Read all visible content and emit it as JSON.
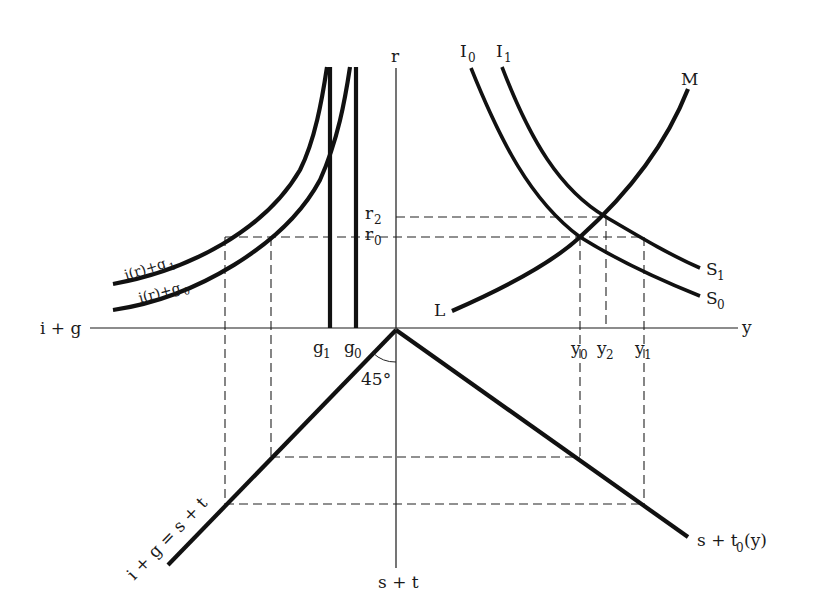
{
  "diagram": {
    "axes": {
      "vertical_top": "r",
      "vertical_bottom": "s + t",
      "horizontal_left": "i + g",
      "horizontal_right": "y"
    },
    "quadrant_ne": {
      "curves": [
        {
          "name": "I0",
          "label": "I",
          "sub": "0",
          "end_label": "S",
          "end_sub": "0"
        },
        {
          "name": "I1",
          "label": "I",
          "sub": "1",
          "end_label": "S",
          "end_sub": "1"
        },
        {
          "name": "LM",
          "label_start": "L",
          "label_end": "M"
        }
      ],
      "r_ticks": [
        {
          "label": "r",
          "sub": "2"
        },
        {
          "label": "r",
          "sub": "0"
        }
      ],
      "y_ticks": [
        {
          "label": "y",
          "sub": "0"
        },
        {
          "label": "y",
          "sub": "2"
        },
        {
          "label": "y",
          "sub": "1"
        }
      ]
    },
    "quadrant_nw": {
      "curves": [
        {
          "label": "i(r)+g",
          "sub": "1"
        },
        {
          "label": "i(r)+g",
          "sub": "0"
        }
      ],
      "g_ticks": [
        {
          "label": "g",
          "sub": "1"
        },
        {
          "label": "g",
          "sub": "0"
        }
      ]
    },
    "quadrant_sw": {
      "line_label": "i + g = s + t",
      "angle_label": "45°"
    },
    "quadrant_se": {
      "line_label": "s + t",
      "line_sub": "0",
      "line_suffix": "(y)"
    }
  }
}
